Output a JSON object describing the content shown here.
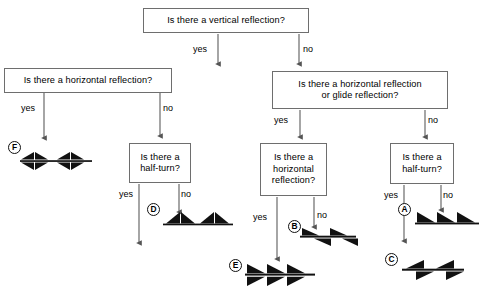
{
  "diagram": {
    "title_text": "Frieze pattern symmetry classification flowchart",
    "colors": {
      "box_border": "#6e6e6e",
      "line": "#555555",
      "glyph": "#111111",
      "text": "#000000",
      "background": "#ffffff"
    },
    "boxes": [
      {
        "id": "q-vertical",
        "lines": [
          "Is there a vertical reflection?"
        ]
      },
      {
        "id": "q-horizontal-left",
        "lines": [
          "Is there a horizontal reflection?"
        ]
      },
      {
        "id": "q-horizontal-or-glide",
        "lines": [
          "Is there a horizontal reflection",
          "or glide reflection?"
        ]
      },
      {
        "id": "q-halfturn-left",
        "lines": [
          "Is there a",
          "half-turn?"
        ]
      },
      {
        "id": "q-horizontal-mid",
        "lines": [
          "Is there a",
          "horizontal",
          "reflection?"
        ]
      },
      {
        "id": "q-halfturn-right",
        "lines": [
          "Is there a",
          "half-turn?"
        ]
      }
    ],
    "edge_labels": {
      "root_yes": "yes",
      "root_no": "no",
      "left_yes": "yes",
      "left_no": "no",
      "right_yes": "yes",
      "right_no": "no",
      "halfturn_left_yes": "yes",
      "halfturn_left_no": "no",
      "horizontal_mid_yes": "yes",
      "horizontal_mid_no": "no",
      "halfturn_right_yes": "yes",
      "halfturn_right_no": "no"
    },
    "outcomes": [
      {
        "tag": "F",
        "pattern": "bowtie-mirror"
      },
      {
        "tag": "D",
        "pattern": "peak-pairs"
      },
      {
        "tag": "E",
        "pattern": "triangle-mirror-stack"
      },
      {
        "tag": "B",
        "pattern": "triangle-glide"
      },
      {
        "tag": "A",
        "pattern": "triangle-translation"
      },
      {
        "tag": "C",
        "pattern": "triangle-halfturn"
      }
    ]
  }
}
